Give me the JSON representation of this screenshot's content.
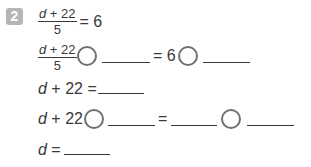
{
  "problem": {
    "number": "2",
    "given": {
      "numerator_var": "d",
      "numerator_rest": " + 22",
      "denominator": "5",
      "rhs": "= 6"
    },
    "step1": {
      "numerator_var": "d",
      "numerator_rest": " + 22",
      "denominator": "5",
      "equals": "= 6"
    },
    "step2": {
      "var": "d",
      "rest": " + 22 ="
    },
    "step3": {
      "var": "d",
      "rest": " + 22",
      "equals": "="
    },
    "step4": {
      "var": "d",
      "rest": " ="
    }
  },
  "colors": {
    "badge": "#b5b5b5",
    "text": "#3a3a3a",
    "circle": "#707070"
  }
}
